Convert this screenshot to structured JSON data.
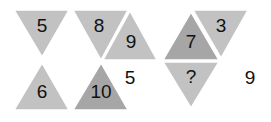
{
  "puzzle": {
    "colors": {
      "light": "#c2c2c2",
      "dark": "#a6a6a6",
      "text": "#111111",
      "background": "#ffffff"
    },
    "triangles": [
      {
        "value": "5",
        "points": "14,10 69,10 42,57",
        "fill": "light",
        "tx": 42,
        "ty": 27
      },
      {
        "value": "8",
        "points": "73,10 128,10 101,60",
        "fill": "light",
        "tx": 99,
        "ty": 27
      },
      {
        "value": "9",
        "points": "130,11 157,60 103,60",
        "fill": "light",
        "tx": 131,
        "ty": 43
      },
      {
        "value": "7",
        "points": "191,12 219,60 163,60",
        "fill": "dark",
        "tx": 191,
        "ty": 43
      },
      {
        "value": "3",
        "points": "193,10 248,10 221,58",
        "fill": "light",
        "tx": 221,
        "ty": 27
      },
      {
        "value": "?",
        "points": "163,62 219,62 191,108",
        "fill": "light",
        "tx": 191,
        "ty": 78
      },
      {
        "value": "6",
        "points": "42,63 69,110 14,110",
        "fill": "light",
        "tx": 42,
        "ty": 93
      },
      {
        "value": "10",
        "points": "101,63 128,110 73,110",
        "fill": "dark",
        "tx": 101,
        "ty": 93
      }
    ],
    "loose_numbers": [
      {
        "value": "5",
        "tx": 130,
        "ty": 79
      },
      {
        "value": "9",
        "tx": 250,
        "ty": 79
      }
    ]
  }
}
